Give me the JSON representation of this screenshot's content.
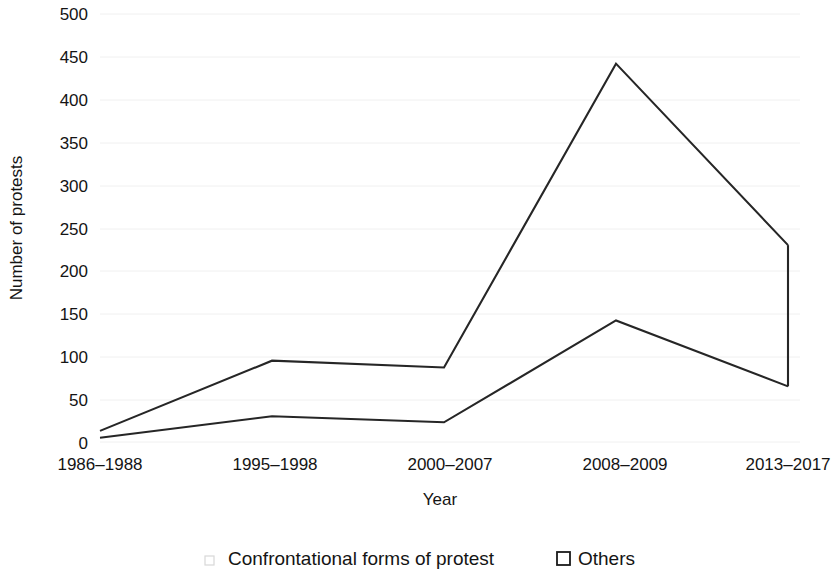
{
  "chart_data": {
    "type": "line",
    "title": "",
    "xlabel": "Year",
    "ylabel": "Number of protests",
    "categories": [
      "1986–1988",
      "1995–1998",
      "2000–2007",
      "2008–2009",
      "2013–2017"
    ],
    "series": [
      {
        "name": "Confrontational forms of protest",
        "values": [
          13,
          95,
          87,
          442,
          230
        ],
        "marker": "line"
      },
      {
        "name": "Others",
        "values": [
          5,
          30,
          23,
          142,
          65
        ],
        "marker": "open-square"
      }
    ],
    "ylim": [
      0,
      500
    ],
    "ytick_labels": [
      "0",
      "50",
      "100",
      "150",
      "200",
      "250",
      "300",
      "350",
      "400",
      "450",
      "500"
    ],
    "ytick_values": [
      0,
      50,
      100,
      150,
      200,
      250,
      300,
      350,
      400,
      450,
      500
    ],
    "grid": "faint-horizontal",
    "legend_position": "bottom",
    "axis_color": "#262626",
    "line_color": "#262626"
  },
  "legend": {
    "entries": [
      {
        "label": "Confrontational forms of protest",
        "marker": "line-marker"
      },
      {
        "label": "Others",
        "marker": "open-square-marker"
      }
    ]
  }
}
